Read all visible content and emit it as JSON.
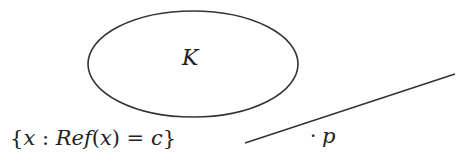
{
  "diagram": {
    "set_label": "K",
    "level_set_label": {
      "open_brace": "{",
      "var": "x",
      "colon": " : ",
      "func": "Ref",
      "lparen": "(",
      "arg": "x",
      "rparen": ")",
      "equals": " = ",
      "const": "c",
      "close_brace": "}"
    },
    "point_dot": "·",
    "point_label": "p",
    "stroke_color": "#333333"
  }
}
